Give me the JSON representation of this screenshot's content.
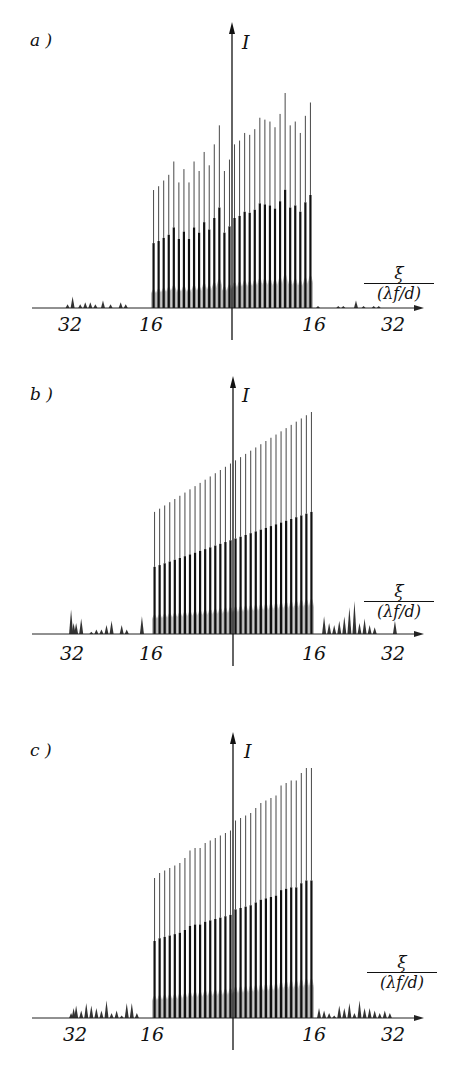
{
  "figure": {
    "panels": [
      {
        "id": "a",
        "label": "a )",
        "ylabel": "I",
        "xlabel_num": "ξ",
        "xlabel_den": "(λf/d)",
        "ticks": [
          {
            "label": "32",
            "pos": -32
          },
          {
            "label": "16",
            "pos": -16
          },
          {
            "label": "16",
            "pos": 16
          },
          {
            "label": "32",
            "pos": 32
          }
        ]
      },
      {
        "id": "b",
        "label": "b )",
        "ylabel": "I",
        "xlabel_num": "ξ",
        "xlabel_den": "(λf/d)",
        "ticks": [
          {
            "label": "32",
            "pos": -32
          },
          {
            "label": "16",
            "pos": -16
          },
          {
            "label": "16",
            "pos": 16
          },
          {
            "label": "32",
            "pos": 32
          }
        ]
      },
      {
        "id": "c",
        "label": "c )",
        "ylabel": "I",
        "xlabel_num": "ξ",
        "xlabel_den": "(λf/d)",
        "ticks": [
          {
            "label": "32",
            "pos": -32
          },
          {
            "label": "16",
            "pos": -16
          },
          {
            "label": "16",
            "pos": 16
          },
          {
            "label": "32",
            "pos": 32
          }
        ]
      }
    ]
  },
  "chart_data": [
    {
      "type": "bar",
      "title": "a)",
      "xlabel": "ξ / (λf/d)",
      "ylabel": "I",
      "xlim": [
        -36,
        38
      ],
      "xticks": [
        -32,
        -16,
        16,
        32
      ],
      "xtick_labels": [
        "32",
        "16",
        "16",
        "32"
      ],
      "grid": false,
      "main_peaks_x_range": [
        -16,
        16
      ],
      "main_peaks_count": 32,
      "main_peaks_relative_height": [
        0.62,
        0.64,
        0.67,
        0.7,
        0.77,
        0.66,
        0.73,
        0.66,
        0.77,
        0.72,
        0.82,
        0.75,
        0.86,
        0.96,
        0.72,
        0.78,
        0.86,
        0.88,
        0.92,
        0.91,
        0.94,
        1.0,
        0.99,
        0.98,
        0.95,
        1.02,
        1.13,
        0.96,
        0.98,
        0.92,
        1.01,
        1.08
      ],
      "side_lobes_left_x": [
        -32.5,
        -31.5,
        -30,
        -29,
        -28,
        -27,
        -25.5,
        -24,
        -22,
        -21
      ],
      "side_lobes_left_relative_height": [
        0.02,
        0.06,
        0.02,
        0.03,
        0.03,
        0.02,
        0.04,
        0.02,
        0.03,
        0.02
      ],
      "side_lobes_right_x": [
        17,
        21,
        22,
        24.5,
        26,
        28,
        29
      ],
      "side_lobes_right_relative_height": [
        0.01,
        0.01,
        0.01,
        0.04,
        0.01,
        0.01,
        0.01
      ]
    },
    {
      "type": "bar",
      "title": "b)",
      "xlabel": "ξ / (λf/d)",
      "ylabel": "I",
      "xlim": [
        -36,
        38
      ],
      "xticks": [
        -32,
        -16,
        16,
        32
      ],
      "xtick_labels": [
        "32",
        "16",
        "16",
        "32"
      ],
      "grid": false,
      "main_peaks_x_range": [
        -16,
        16
      ],
      "main_peaks_count": 32,
      "main_peaks_relative_height": "linear ramp from 0.55 (ξ=-16) to 1.00 (ξ=+16)",
      "side_lobes_left_x": [
        -32,
        -31.5,
        -31,
        -30,
        -28,
        -27,
        -26,
        -25,
        -24,
        -22,
        -21,
        -18
      ],
      "side_lobes_left_relative_height": [
        0.11,
        0.05,
        0.05,
        0.07,
        0.01,
        0.02,
        0.02,
        0.04,
        0.06,
        0.04,
        0.02,
        0.08
      ],
      "side_lobes_right_x": [
        18,
        19,
        20,
        21,
        22,
        23,
        24,
        25,
        26,
        27,
        28,
        32
      ],
      "side_lobes_right_relative_height": [
        0.08,
        0.05,
        0.04,
        0.06,
        0.08,
        0.12,
        0.15,
        0.05,
        0.07,
        0.04,
        0.03,
        0.06
      ]
    },
    {
      "type": "bar",
      "title": "c)",
      "xlabel": "ξ / (λf/d)",
      "ylabel": "I",
      "xlim": [
        -36,
        38
      ],
      "xticks": [
        -32,
        -16,
        16,
        32
      ],
      "xtick_labels": [
        "32",
        "16",
        "16",
        "32"
      ],
      "grid": false,
      "main_peaks_x_range": [
        -16,
        16
      ],
      "main_peaks_count": 32,
      "main_peaks_relative_height": [
        0.56,
        0.58,
        0.59,
        0.6,
        0.61,
        0.62,
        0.64,
        0.67,
        0.68,
        0.68,
        0.7,
        0.71,
        0.72,
        0.73,
        0.74,
        0.75,
        0.79,
        0.8,
        0.81,
        0.82,
        0.84,
        0.86,
        0.87,
        0.88,
        0.89,
        0.93,
        0.94,
        0.95,
        0.95,
        0.98,
        1.0,
        1.0
      ],
      "side_lobes_left_x": [
        -32,
        -31.5,
        -31,
        -30,
        -29,
        -28,
        -27,
        -26,
        -25,
        -24,
        -23,
        -22,
        -21,
        -20,
        -19
      ],
      "side_lobes_left_relative_height": [
        0.02,
        0.04,
        0.05,
        0.03,
        0.06,
        0.05,
        0.04,
        0.03,
        0.07,
        0.02,
        0.03,
        0.01,
        0.06,
        0.06,
        0.02
      ],
      "side_lobes_right_x": [
        17,
        18,
        19,
        20,
        21,
        22,
        23,
        24,
        25,
        26,
        27,
        28,
        29,
        30,
        31
      ],
      "side_lobes_right_relative_height": [
        0.04,
        0.03,
        0.02,
        0.01,
        0.05,
        0.04,
        0.06,
        0.02,
        0.07,
        0.04,
        0.04,
        0.03,
        0.02,
        0.03,
        0.02
      ]
    }
  ]
}
